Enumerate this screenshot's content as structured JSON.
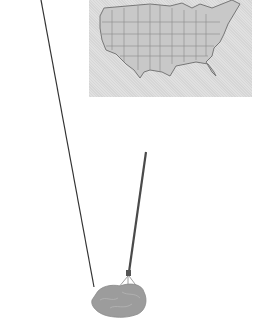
{
  "image": {
    "description": "Grayscale photo-style illustration of a mop with a long handle next to a framed map of the contiguous United States",
    "objects": [
      {
        "name": "us-map",
        "label": "Map of the contiguous United States with state borders",
        "color": "#d6d6d6"
      },
      {
        "name": "mop",
        "label": "String mop with long handle",
        "head_color": "#9a9a9a",
        "handle_color": "#444444"
      },
      {
        "name": "diagonal-line",
        "label": "Thin dark diagonal line (second pole/string)",
        "color": "#333333"
      }
    ],
    "background": "#ffffff"
  }
}
